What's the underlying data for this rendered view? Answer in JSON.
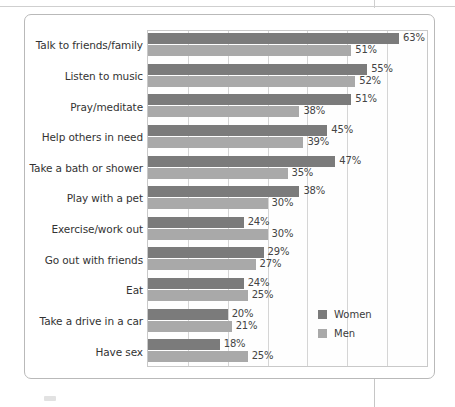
{
  "chart_data": {
    "type": "bar",
    "orientation": "horizontal",
    "title": "",
    "subtitle": "",
    "xlabel": "",
    "ylabel": "",
    "xlim": [
      0,
      70
    ],
    "grid": true,
    "grid_axis": "x",
    "gridline_values": [
      10,
      20,
      30,
      40,
      50,
      60
    ],
    "legend_position": "inside-bottom-right",
    "value_suffix": "%",
    "categories": [
      "Talk to friends/family",
      "Listen to music",
      "Pray/meditate",
      "Help others in need",
      "Take a bath or shower",
      "Play with a pet",
      "Exercise/work out",
      "Go out with friends",
      "Eat",
      "Take a drive in a car",
      "Have sex"
    ],
    "series": [
      {
        "name": "Women",
        "color": "#7b7b7b",
        "values": [
          63,
          55,
          51,
          45,
          47,
          38,
          24,
          29,
          24,
          20,
          18
        ],
        "labels": [
          "63%",
          "55%",
          "51%",
          "45%",
          "47%",
          "38%",
          "24%",
          "29%",
          "24%",
          "20%",
          "18%"
        ]
      },
      {
        "name": "Men",
        "color": "#a9a9a9",
        "values": [
          51,
          52,
          38,
          39,
          35,
          30,
          30,
          27,
          25,
          21,
          25
        ],
        "labels": [
          "51%",
          "52%",
          "38%",
          "39%",
          "35%",
          "30%",
          "30%",
          "27%",
          "25%",
          "21%",
          "25%"
        ]
      }
    ]
  },
  "legend": {
    "items": [
      {
        "label": "Women",
        "color": "#7b7b7b"
      },
      {
        "label": "Men",
        "color": "#a9a9a9"
      }
    ]
  },
  "colors": {
    "women": "#7b7b7b",
    "men": "#a9a9a9",
    "frame": "#b9b9b9",
    "gridline": "#d5d5d5",
    "text": "#3b3b3b",
    "background": "#ffffff"
  }
}
